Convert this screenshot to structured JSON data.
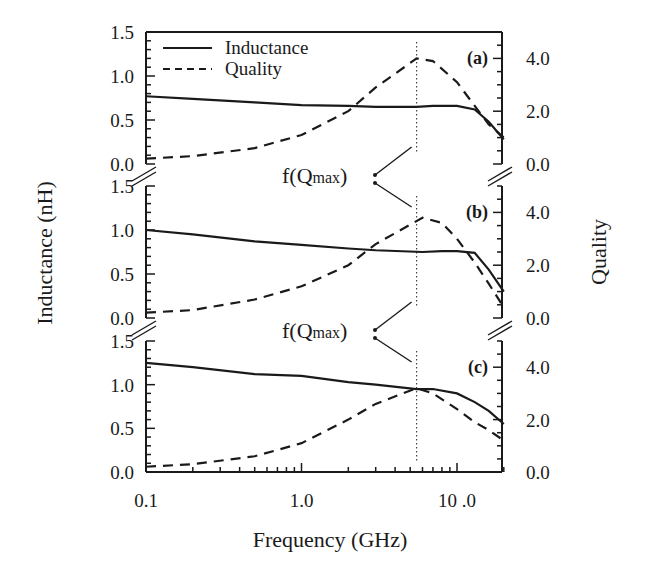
{
  "chart_data": {
    "type": "line",
    "title": "",
    "xlabel": "Frequency (GHz)",
    "ylabel_left": "Inductance (nH)",
    "ylabel_right": "Quality",
    "xscale": "log",
    "xlim": [
      0.1,
      20
    ],
    "x_ticks": [
      "0.1",
      "1.0",
      "10 .0"
    ],
    "left_ticks": [
      "0.0",
      "0.5",
      "1.0",
      "1.5"
    ],
    "right_ticks": [
      "0.0",
      "2.0",
      "4.0"
    ],
    "ylim_left": [
      0,
      1.5
    ],
    "ylim_right": [
      0,
      5.0
    ],
    "legend": {
      "position": "upper-left of panel (a)",
      "entries": [
        {
          "label": "Inductance",
          "style": "solid"
        },
        {
          "label": "Quality",
          "style": "dashed"
        }
      ]
    },
    "annotation": {
      "text": "f(Q",
      "sub": "max",
      "close": ")",
      "description": "Arrows point to vertical dotted line at frequency of maximum Q (~5.5 GHz)"
    },
    "fqmax_ghz": 5.5,
    "panels": [
      {
        "tag": "(a)",
        "x": [
          0.1,
          0.2,
          0.5,
          1.0,
          2.0,
          3.0,
          5.5,
          7.0,
          10.0,
          13.0,
          16.0,
          20.0
        ],
        "series": [
          {
            "name": "Inductance",
            "values": [
              0.77,
              0.74,
              0.7,
              0.67,
              0.66,
              0.65,
              0.65,
              0.66,
              0.66,
              0.62,
              0.48,
              0.28
            ]
          },
          {
            "name": "Quality",
            "values": [
              0.2,
              0.3,
              0.6,
              1.1,
              2.0,
              2.9,
              4.0,
              3.9,
              3.1,
              2.2,
              1.5,
              1.0
            ]
          }
        ]
      },
      {
        "tag": "(b)",
        "x": [
          0.1,
          0.2,
          0.5,
          1.0,
          2.0,
          3.0,
          6.0,
          8.0,
          10.0,
          13.0,
          16.0,
          20.0
        ],
        "series": [
          {
            "name": "Inductance",
            "values": [
              1.0,
              0.95,
              0.87,
              0.83,
              0.79,
              0.77,
              0.75,
              0.76,
              0.76,
              0.74,
              0.55,
              0.3
            ]
          },
          {
            "name": "Quality",
            "values": [
              0.2,
              0.3,
              0.7,
              1.2,
              2.0,
              2.8,
              3.8,
              3.6,
              3.0,
              2.1,
              1.3,
              0.4
            ]
          }
        ]
      },
      {
        "tag": "(c)",
        "x": [
          0.1,
          0.2,
          0.5,
          1.0,
          2.0,
          3.0,
          5.5,
          7.0,
          10.0,
          13.0,
          16.0,
          20.0
        ],
        "series": [
          {
            "name": "Inductance",
            "values": [
              1.25,
              1.2,
              1.12,
              1.1,
              1.03,
              1.0,
              0.95,
              0.95,
              0.9,
              0.8,
              0.7,
              0.55
            ]
          },
          {
            "name": "Quality",
            "values": [
              0.2,
              0.3,
              0.6,
              1.1,
              2.0,
              2.6,
              3.2,
              3.0,
              2.4,
              1.9,
              1.6,
              1.2
            ]
          }
        ]
      }
    ]
  }
}
